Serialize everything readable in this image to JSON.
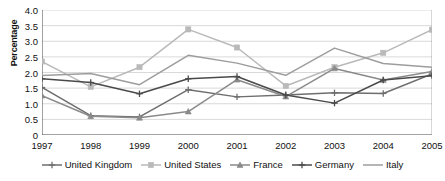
{
  "chart_data": {
    "type": "line",
    "title": "",
    "xlabel": "",
    "ylabel": "Percentage",
    "categories": [
      "1997",
      "1998",
      "1999",
      "2000",
      "2001",
      "2002",
      "2003",
      "2004",
      "2005"
    ],
    "ylim": [
      0,
      4.0
    ],
    "yticks": [
      "0",
      "0.5",
      "1.0",
      "1.5",
      "2.0",
      "2.5",
      "3.0",
      "3.5",
      "4.0"
    ],
    "ytick_values": [
      0,
      0.5,
      1.0,
      1.5,
      2.0,
      2.5,
      3.0,
      3.5,
      4.0
    ],
    "grid": true,
    "legend_position": "bottom",
    "series": [
      {
        "name": "United Kingdom",
        "color": "#6e6e6e",
        "marker": "plus",
        "values": [
          1.52,
          0.62,
          0.58,
          1.45,
          1.22,
          1.28,
          1.35,
          1.33,
          1.95
        ]
      },
      {
        "name": "United States",
        "color": "#b9b9b9",
        "marker": "square",
        "values": [
          2.35,
          1.54,
          2.17,
          3.38,
          2.8,
          1.57,
          2.17,
          2.63,
          3.37
        ]
      },
      {
        "name": "France",
        "color": "#8a8a8a",
        "marker": "triangle",
        "values": [
          1.26,
          0.6,
          0.55,
          0.75,
          1.77,
          1.23,
          2.13,
          1.76,
          2.03
        ]
      },
      {
        "name": "Germany",
        "color": "#4a4a4a",
        "marker": "plus",
        "values": [
          1.8,
          1.68,
          1.32,
          1.8,
          1.87,
          1.28,
          1.02,
          1.76,
          1.9
        ]
      },
      {
        "name": "Italy",
        "color": "#9d9d9d",
        "marker": "none",
        "values": [
          1.9,
          1.97,
          1.61,
          2.55,
          2.3,
          1.91,
          2.78,
          2.29,
          2.17
        ]
      }
    ]
  },
  "axes": {
    "y_title": "Percentage"
  }
}
